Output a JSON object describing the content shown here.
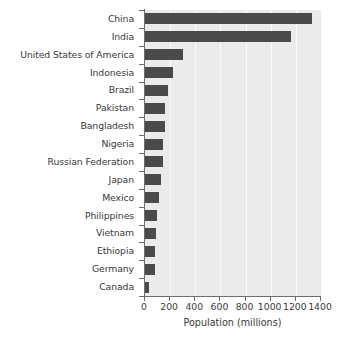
{
  "chart_data": {
    "type": "bar",
    "orientation": "horizontal",
    "title": "",
    "xlabel": "Population (millions)",
    "ylabel": "",
    "xlim": [
      0,
      1400
    ],
    "xticks": [
      0,
      200,
      400,
      600,
      800,
      1000,
      1200,
      1400
    ],
    "xtick_labels": [
      "0",
      "200",
      "400",
      "600",
      "800",
      "1000",
      "1200",
      "1400"
    ],
    "grid": true,
    "grid_axis": "x",
    "legend": false,
    "categories": [
      "China",
      "India",
      "United States of America",
      "Indonesia",
      "Brazil",
      "Pakistan",
      "Bangladesh",
      "Nigeria",
      "Russian Federation",
      "Japan",
      "Mexico",
      "Philippines",
      "Vietnam",
      "Ethiopia",
      "Germany",
      "Canada"
    ],
    "values": [
      1330,
      1160,
      300,
      225,
      185,
      163,
      160,
      143,
      140,
      128,
      108,
      93,
      88,
      80,
      82,
      33
    ],
    "bar_color": "#4a4a4a",
    "plot_background": "#ebebeb",
    "gridline_color": "#fbfbfb",
    "axis_color": "#6e6e6e",
    "text_color": "#3a3a3a"
  }
}
